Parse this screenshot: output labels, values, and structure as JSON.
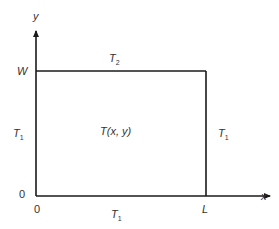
{
  "diagram": {
    "type": "2D rectangular domain with boundary temperatures",
    "axes": {
      "x_label": "x",
      "y_label": "y"
    },
    "origin": {
      "x_tick": "0",
      "y_tick": "0"
    },
    "dimensions": {
      "width_label": "L",
      "height_label": "W"
    },
    "interior_label": "T(x, y)",
    "boundaries": {
      "top": {
        "symbol": "T",
        "subscript": "2"
      },
      "left": {
        "symbol": "T",
        "subscript": "1"
      },
      "right": {
        "symbol": "T",
        "subscript": "1"
      },
      "bottom": {
        "symbol": "T",
        "subscript": "1"
      }
    },
    "colors": {
      "line": "#1a1a1a",
      "text": "#333333",
      "background": "#ffffff"
    }
  }
}
